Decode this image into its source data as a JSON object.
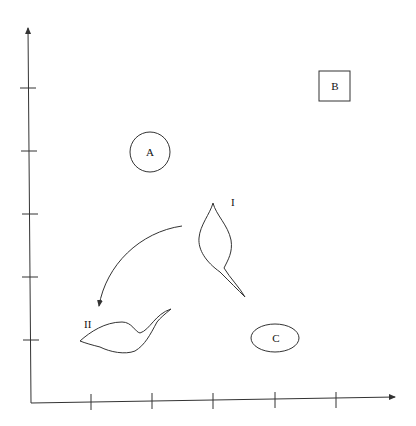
{
  "diagram": {
    "x_axis": {
      "ticks": 5
    },
    "y_axis": {
      "ticks": 5
    },
    "objects": {
      "circle": {
        "label": "A"
      },
      "square": {
        "label": "B"
      },
      "ellipse": {
        "label": "C"
      },
      "shape_one": {
        "label": "I"
      },
      "shape_two": {
        "label": "II"
      }
    },
    "arrow": {
      "from": "I",
      "to": "II",
      "direction": "counter-clockwise curve"
    }
  }
}
